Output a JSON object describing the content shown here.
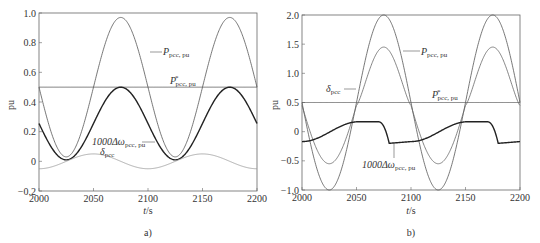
{
  "chart_data": [
    {
      "panel": "a)",
      "type": "line",
      "xlabel": "t/s",
      "ylabel": "pu",
      "xlim": [
        2000,
        2200
      ],
      "ylim": [
        -0.2,
        1.0
      ],
      "xticks": [
        "2000",
        "2050",
        "2100",
        "2150",
        "2200"
      ],
      "yticks": [
        "-0.2",
        "0",
        "0.2",
        "0.4",
        "0.6",
        "0.8",
        "1.0"
      ],
      "grid": false,
      "series": [
        {
          "name": "P_pcc,pu",
          "description": "sinusoid, period 100 s, min ~0.03 at 2025/2125, max ~0.97 at 2075/2175",
          "x": [
            2000,
            2025,
            2050,
            2075,
            2100,
            2125,
            2150,
            2175,
            2200
          ],
          "values": [
            0.5,
            0.03,
            0.5,
            0.97,
            0.5,
            0.03,
            0.5,
            0.97,
            0.5
          ]
        },
        {
          "name": "P*_pcc,pu",
          "description": "constant reference",
          "x": [
            2000,
            2200
          ],
          "values": [
            0.5,
            0.5
          ]
        },
        {
          "name": "1000Δω_pcc,pu",
          "description": "sinusoid, period 100 s, min ~0.01, max ~0.5",
          "x": [
            2000,
            2025,
            2050,
            2075,
            2100,
            2125,
            2150,
            2175,
            2200
          ],
          "values": [
            0.25,
            0.01,
            0.25,
            0.5,
            0.25,
            0.01,
            0.25,
            0.5,
            0.25
          ]
        },
        {
          "name": "δ_pcc",
          "description": "small sinusoid, amplitude ~0.05",
          "x": [
            2000,
            2025,
            2050,
            2075,
            2100,
            2125,
            2150,
            2175,
            2200
          ],
          "values": [
            -0.05,
            0.0,
            0.05,
            0.0,
            -0.05,
            0.0,
            0.05,
            0.0,
            -0.05
          ]
        }
      ],
      "annotations": [
        "P_pcc,pu",
        "P*_pcc,pu",
        "1000Δω_pcc,pu",
        "δ_pcc"
      ]
    },
    {
      "panel": "b)",
      "type": "line",
      "xlabel": "t/s",
      "ylabel": "pu",
      "xlim": [
        2000,
        2200
      ],
      "ylim": [
        -1.0,
        2.0
      ],
      "xticks": [
        "2000",
        "2050",
        "2100",
        "2150",
        "2200"
      ],
      "yticks": [
        "-1.0",
        "-0.5",
        "0",
        "0.5",
        "1.0",
        "1.5",
        "2.0"
      ],
      "grid": false,
      "series": [
        {
          "name": "P_pcc,pu",
          "description": "sinusoid, period 100 s, min -1.0 at 2025/2125, max 2.0 at 2075/2175",
          "x": [
            2000,
            2025,
            2050,
            2075,
            2100,
            2125,
            2150,
            2175,
            2200
          ],
          "values": [
            0.5,
            -1.0,
            0.5,
            2.0,
            0.5,
            -1.0,
            0.5,
            2.0,
            0.5
          ]
        },
        {
          "name": "δ_pcc",
          "description": "distorted wave, min ~-0.55, max ~1.45",
          "x": [
            2000,
            2025,
            2050,
            2075,
            2100,
            2125,
            2150,
            2175,
            2200
          ],
          "values": [
            0.3,
            -0.55,
            0.45,
            1.45,
            0.3,
            -0.55,
            0.45,
            1.45,
            0.3
          ]
        },
        {
          "name": "P*_pcc,pu",
          "description": "constant reference",
          "x": [
            2000,
            2200
          ],
          "values": [
            0.5,
            0.5
          ]
        },
        {
          "name": "1000Δω_pcc,pu",
          "description": "rising ramp then sharp drop at ~2078/2178",
          "x": [
            2000,
            2025,
            2050,
            2070,
            2078,
            2080,
            2100,
            2125,
            2150,
            2170,
            2178,
            2180,
            2200
          ],
          "values": [
            -0.17,
            -0.05,
            0.15,
            0.17,
            -0.15,
            -0.2,
            -0.17,
            -0.05,
            0.15,
            0.17,
            -0.15,
            -0.2,
            -0.18
          ]
        }
      ],
      "annotations": [
        "P_pcc,pu",
        "δ_pcc",
        "P*_pcc,pu",
        "1000Δω_pcc,pu"
      ]
    }
  ],
  "captions": {
    "a": "a)",
    "b": "b)"
  },
  "axis": {
    "xlabel_main": "t",
    "xlabel_unit": "/s",
    "ylabel": "pu"
  },
  "labels": {
    "p_main": "P",
    "p_sub": "pcc, pu",
    "pstar_main": "P",
    "pstar_sup": "*",
    "pstar_sub": "pcc, pu",
    "domega_main": "1000Δω",
    "domega_sub": "pcc, pu",
    "delta_main": "δ",
    "delta_sub": "pcc"
  },
  "ticks_a": {
    "x": [
      "2000",
      "2050",
      "2100",
      "2150",
      "2200"
    ],
    "y": [
      "1.0",
      "0.8",
      "0.6",
      "0.4",
      "0.2",
      "0",
      "−0.2"
    ]
  },
  "ticks_b": {
    "x": [
      "2000",
      "2050",
      "2100",
      "2150",
      "2200"
    ],
    "y": [
      "2.0",
      "1.5",
      "1.0",
      "0.5",
      "0",
      "−0.5",
      "−1.0"
    ]
  }
}
